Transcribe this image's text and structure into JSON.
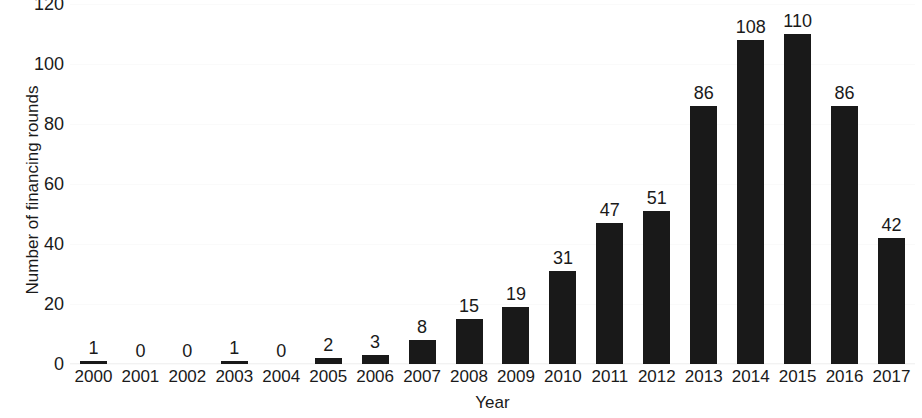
{
  "chart_data": {
    "type": "bar",
    "title": "",
    "xlabel": "Year",
    "ylabel": "Number of financing rounds",
    "categories": [
      "2000",
      "2001",
      "2002",
      "2003",
      "2004",
      "2005",
      "2006",
      "2007",
      "2008",
      "2009",
      "2010",
      "2011",
      "2012",
      "2013",
      "2014",
      "2015",
      "2016",
      "2017"
    ],
    "values": [
      1,
      0,
      0,
      1,
      0,
      2,
      3,
      8,
      15,
      19,
      31,
      47,
      51,
      86,
      108,
      110,
      86,
      42
    ],
    "value_labels": [
      "1",
      "0",
      "0",
      "1",
      "0",
      "2",
      "3",
      "8",
      "15",
      "19",
      "31",
      "47",
      "51",
      "86",
      "108",
      "110",
      "86",
      "42"
    ],
    "ylim": [
      0,
      120
    ],
    "yticks": [
      0,
      20,
      40,
      60,
      80,
      100,
      120
    ],
    "ytick_labels": [
      "0",
      "20",
      "40",
      "60",
      "80",
      "100",
      "120"
    ],
    "grid": true,
    "grid_color": "#fafafa",
    "bar_color": "#191919",
    "background_color": "#ffffff",
    "legend": null,
    "show_value_labels": true
  }
}
